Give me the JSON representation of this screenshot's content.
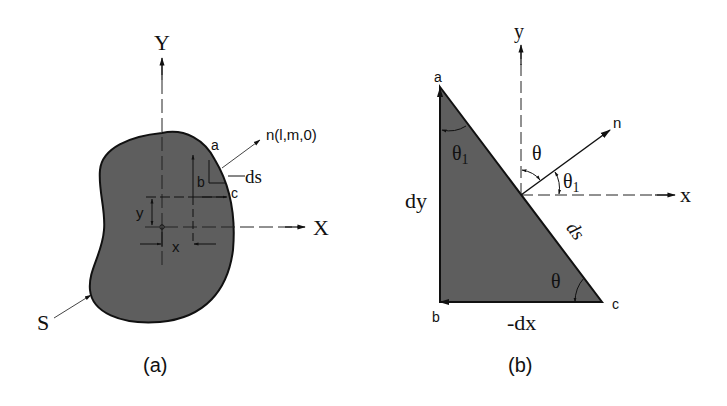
{
  "figure_a": {
    "caption": "(a)",
    "axis_y_label": "Y",
    "axis_x_label": "X",
    "boundary_label": "S",
    "normal_label": "n(l,m,0)",
    "point_a": "a",
    "point_b": "b",
    "point_c": "c",
    "ds_label": "ds",
    "dim_x_label": "x",
    "dim_y_label": "y"
  },
  "figure_b": {
    "caption": "(b)",
    "axis_y_label": "y",
    "axis_x_label": "x",
    "normal_label": "n",
    "point_a": "a",
    "point_b": "b",
    "point_c": "c",
    "dy_label": "dy",
    "dx_label": "-dx",
    "ds_label": "ds",
    "theta_top_label": "θ",
    "theta1_right_label": "θ",
    "theta1_right_sub": "1",
    "theta1_left_label": "θ",
    "theta1_left_sub": "1",
    "theta_bottom_label": "θ"
  },
  "colors": {
    "fill": "#5e5e5e",
    "stroke": "#111111",
    "background": "#ffffff"
  }
}
